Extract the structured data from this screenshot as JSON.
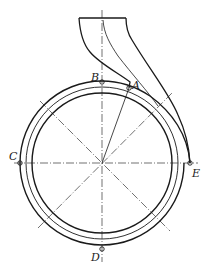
{
  "diagram": {
    "type": "pump volute casing cross-section",
    "stroke_color": "#1a1a1a",
    "centerline_color": "#333333",
    "points": [
      {
        "id": "A",
        "label": "A"
      },
      {
        "id": "B",
        "label": "B"
      },
      {
        "id": "C",
        "label": "C"
      },
      {
        "id": "D",
        "label": "D"
      },
      {
        "id": "E",
        "label": "E"
      }
    ]
  }
}
